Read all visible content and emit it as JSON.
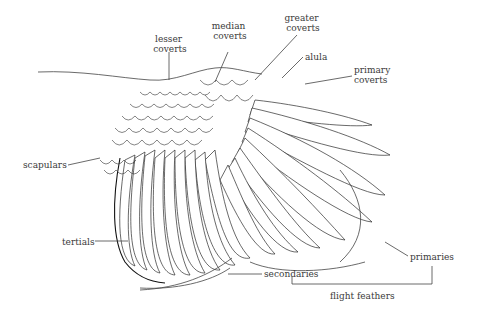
{
  "diagram": {
    "labels": {
      "lesser_coverts": [
        "lesser",
        "coverts"
      ],
      "median_coverts": [
        "median",
        "coverts"
      ],
      "greater_coverts": [
        "greater",
        "coverts"
      ],
      "alula": "alula",
      "primary_coverts": [
        "primary",
        "coverts"
      ],
      "scapulars": "scapulars",
      "tertials": "tertials",
      "secondaries": "secondaries",
      "primaries": "primaries",
      "flight_feathers": "flight feathers"
    },
    "colors": {
      "ink": "#2a2a2a",
      "label": "#3a3a3a",
      "background": "#ffffff"
    }
  }
}
